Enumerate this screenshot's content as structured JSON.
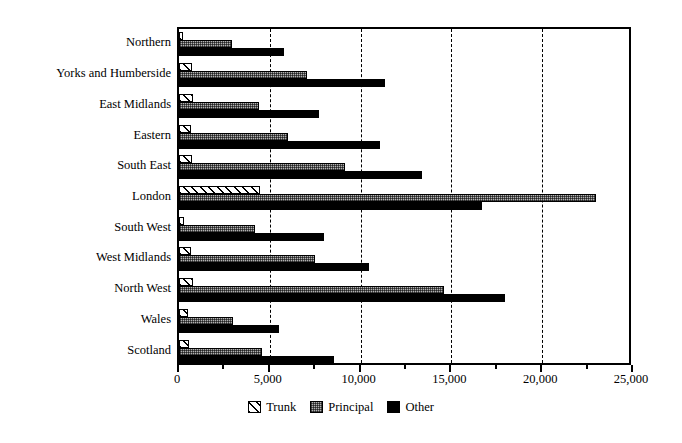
{
  "chart_data": {
    "type": "bar",
    "orientation": "horizontal",
    "title": "",
    "xlabel": "",
    "ylabel": "",
    "xlim": [
      0,
      25000
    ],
    "grid": true,
    "gridlines_x": [
      5000,
      10000,
      15000,
      20000
    ],
    "xticks": [
      0,
      5000,
      10000,
      15000,
      20000,
      25000
    ],
    "xticklabels": [
      "0",
      "5,000",
      "10,000",
      "15,000",
      "20,000",
      "25,000"
    ],
    "minor_xticks": [
      2500,
      7500,
      12500,
      17500,
      22500
    ],
    "legend_position": "bottom-center",
    "categories": [
      "Northern",
      "Yorks and Humberside",
      "East Midlands",
      "Eastern",
      "South East",
      "London",
      "South West",
      "West Midlands",
      "North West",
      "Wales",
      "Scotland"
    ],
    "series": [
      {
        "name": "Trunk",
        "pattern": "diagonal-hatch",
        "color": "#ffffff",
        "values": [
          220,
          715,
          770,
          660,
          715,
          4460,
          280,
          660,
          770,
          500,
          550
        ]
      },
      {
        "name": "Principal",
        "pattern": "dotted-gray",
        "color": "#b3b3b3",
        "values": [
          2920,
          7050,
          4410,
          6000,
          9140,
          22960,
          4190,
          7490,
          14590,
          3000,
          4570
        ]
      },
      {
        "name": "Other",
        "pattern": "solid",
        "color": "#000000",
        "values": [
          5780,
          11350,
          7710,
          11070,
          13380,
          16680,
          7980,
          10460,
          17950,
          5480,
          8520
        ]
      }
    ]
  },
  "legend": {
    "items": [
      {
        "label": "Trunk"
      },
      {
        "label": "Principal"
      },
      {
        "label": "Other"
      }
    ]
  }
}
